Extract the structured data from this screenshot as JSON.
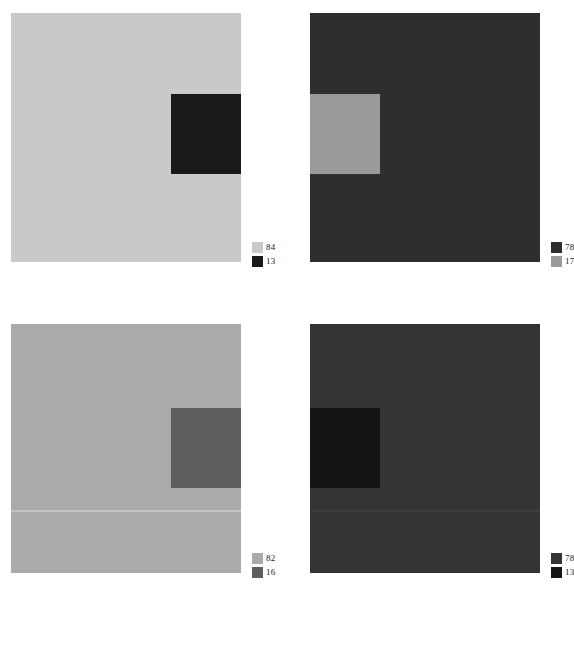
{
  "figure": {
    "type": "image-panel-grid",
    "rows": 2,
    "columns": 2,
    "background_color": "#ffffff",
    "panels": [
      {
        "id": "panel-top-left",
        "position": "top-left",
        "x": 11,
        "y": 13,
        "width": 230,
        "height": 249,
        "background_color": "#c9c9c9",
        "inset": {
          "name": "dark-square-region",
          "x": 160,
          "y": 81,
          "width": 70,
          "height": 80,
          "color": "#1a1a1a"
        },
        "divider": null,
        "legend": {
          "x": 241,
          "y": 228,
          "entries": [
            {
              "swatch_color": "#c9c9c9",
              "value": "84"
            },
            {
              "swatch_color": "#1a1a1a",
              "value": "13"
            }
          ]
        }
      },
      {
        "id": "panel-top-right",
        "position": "top-right",
        "x": 310,
        "y": 13,
        "width": 230,
        "height": 249,
        "background_color": "#2e2e2e",
        "inset": {
          "name": "light-square-region",
          "x": 0,
          "y": 81,
          "width": 70,
          "height": 80,
          "color": "#9a9a9a"
        },
        "divider": null,
        "legend": {
          "x": 241,
          "y": 228,
          "entries": [
            {
              "swatch_color": "#2e2e2e",
              "value": "78"
            },
            {
              "swatch_color": "#9a9a9a",
              "value": "17"
            }
          ]
        }
      },
      {
        "id": "panel-bottom-left",
        "position": "bottom-left",
        "x": 11,
        "y": 324,
        "width": 230,
        "height": 249,
        "background_color": "#aaaaaa",
        "inset": {
          "name": "dark-square-region",
          "x": 160,
          "y": 84,
          "width": 70,
          "height": 80,
          "color": "#5e5e5e"
        },
        "divider": {
          "name": "horizontal-seam",
          "y": 186,
          "height": 2,
          "color": "#c4c4c4"
        },
        "legend": {
          "x": 241,
          "y": 228,
          "entries": [
            {
              "swatch_color": "#aaaaaa",
              "value": "82"
            },
            {
              "swatch_color": "#5e5e5e",
              "value": "16"
            }
          ]
        }
      },
      {
        "id": "panel-bottom-right",
        "position": "bottom-right",
        "x": 310,
        "y": 324,
        "width": 230,
        "height": 249,
        "background_color": "#343434",
        "inset": {
          "name": "dark-square-region",
          "x": 0,
          "y": 84,
          "width": 70,
          "height": 80,
          "color": "#141414"
        },
        "divider": {
          "name": "horizontal-seam",
          "y": 186,
          "height": 2,
          "color": "#3d3d3d"
        },
        "legend": {
          "x": 241,
          "y": 228,
          "entries": [
            {
              "swatch_color": "#343434",
              "value": "78"
            },
            {
              "swatch_color": "#141414",
              "value": "13"
            }
          ]
        }
      }
    ]
  },
  "chart_data": {
    "type": "heatmap",
    "title": "",
    "xlabel": "",
    "ylabel": "",
    "legend_position": "bottom-right-outside",
    "grid": false,
    "series": [
      {
        "name": "panel-top-left",
        "categories": [
          "background",
          "inset"
        ],
        "values": [
          84,
          13
        ],
        "colors": [
          "#c9c9c9",
          "#1a1a1a"
        ]
      },
      {
        "name": "panel-top-right",
        "categories": [
          "background",
          "inset"
        ],
        "values": [
          78,
          17
        ],
        "colors": [
          "#2e2e2e",
          "#9a9a9a"
        ]
      },
      {
        "name": "panel-bottom-left",
        "categories": [
          "background",
          "inset"
        ],
        "values": [
          82,
          16
        ],
        "colors": [
          "#aaaaaa",
          "#5e5e5e"
        ]
      },
      {
        "name": "panel-bottom-right",
        "categories": [
          "background",
          "inset"
        ],
        "values": [
          78,
          13
        ],
        "colors": [
          "#343434",
          "#141414"
        ]
      }
    ]
  }
}
